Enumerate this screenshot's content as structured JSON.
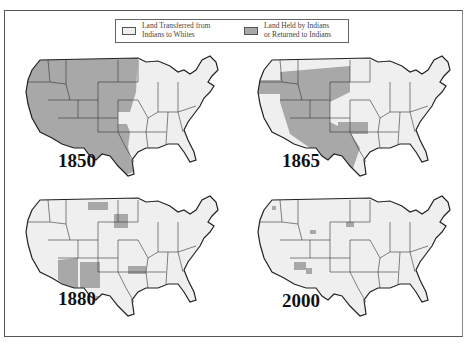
{
  "legend": {
    "items": [
      {
        "label": "Land Transferred from\nIndians to Whites",
        "color": "#efefef"
      },
      {
        "label": "Land Held by Indians\nor Returned to Indians",
        "color": "#a8a8a8"
      }
    ]
  },
  "maps": [
    {
      "year": "1850"
    },
    {
      "year": "1865"
    },
    {
      "year": "1880"
    },
    {
      "year": "2000"
    }
  ],
  "colors": {
    "held": "#a8a8a8",
    "transferred": "#efefef",
    "border": "#222222"
  }
}
